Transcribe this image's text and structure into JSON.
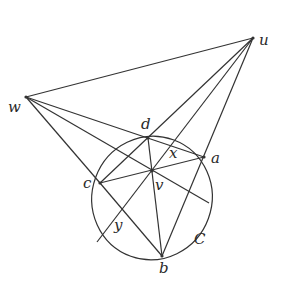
{
  "diagram": {
    "title": "",
    "stroke_color": "#333333",
    "conic_label": "C",
    "points": [
      {
        "id": "u",
        "label": "u",
        "x": 253,
        "y": 38,
        "lx": 259,
        "ly": 33
      },
      {
        "id": "w",
        "label": "w",
        "x": 26,
        "y": 97,
        "lx": 8,
        "ly": 100
      },
      {
        "id": "d",
        "label": "d",
        "x": 148,
        "y": 138,
        "lx": 141,
        "ly": 117
      },
      {
        "id": "a",
        "label": "a",
        "x": 204,
        "y": 157,
        "lx": 211,
        "ly": 151
      },
      {
        "id": "c",
        "label": "c",
        "x": 100,
        "y": 183,
        "lx": 83,
        "ly": 176
      },
      {
        "id": "v",
        "label": "v",
        "x": 152,
        "y": 171,
        "lx": 155,
        "ly": 178
      },
      {
        "id": "x",
        "label": "x",
        "x": 174,
        "y": 156,
        "lx": 169,
        "ly": 146
      },
      {
        "id": "y",
        "label": "y",
        "x": 122,
        "y": 210,
        "lx": 114,
        "ly": 218
      },
      {
        "id": "b",
        "label": "b",
        "x": 162,
        "y": 256,
        "lx": 159,
        "ly": 261
      }
    ],
    "segments": [
      [
        "u",
        "w"
      ],
      [
        "u",
        "c"
      ],
      [
        "u",
        "P1"
      ],
      [
        "u",
        "b"
      ],
      [
        "w",
        "a"
      ],
      [
        "w",
        "P2"
      ],
      [
        "w",
        "c"
      ],
      [
        "d",
        "b"
      ],
      [
        "c",
        "a"
      ],
      [
        "c",
        "b"
      ]
    ],
    "extra_points": {
      "P1": {
        "x": 97,
        "y": 242
      },
      "P2": {
        "x": 209,
        "y": 203
      }
    },
    "ellipse": {
      "cx": 152,
      "cy": 198,
      "rx": 60,
      "ry": 62,
      "rotate": 20
    },
    "conic_label_pos": {
      "x": 194,
      "y": 232
    }
  }
}
